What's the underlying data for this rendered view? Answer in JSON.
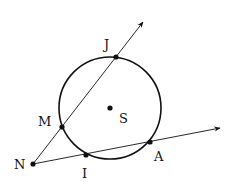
{
  "diagram": {
    "type": "geometry-circle-secants",
    "circle": {
      "center_label": "S",
      "cx": 110,
      "cy": 108,
      "r": 51
    },
    "points": [
      {
        "id": "J",
        "label": "J",
        "x": 116,
        "y": 57,
        "lx": 104,
        "ly": 49
      },
      {
        "id": "M",
        "label": "M",
        "x": 62,
        "y": 127,
        "lx": 38,
        "ly": 126
      },
      {
        "id": "N",
        "label": "N",
        "x": 33,
        "y": 164,
        "lx": 14,
        "ly": 169
      },
      {
        "id": "I",
        "label": "I",
        "x": 86,
        "y": 155,
        "lx": 82,
        "ly": 178
      },
      {
        "id": "A",
        "label": "A",
        "x": 150,
        "y": 142,
        "lx": 154,
        "ly": 161
      },
      {
        "id": "S",
        "label": "S",
        "x": 110,
        "y": 108,
        "lx": 119,
        "ly": 123
      }
    ],
    "rays": [
      {
        "name": "ray-NJ",
        "from": "N",
        "through": [
          "M",
          "J"
        ],
        "x1": 33,
        "y1": 164,
        "x2": 143,
        "y2": 22
      },
      {
        "name": "ray-NA",
        "from": "N",
        "through": [
          "I",
          "A"
        ],
        "x1": 33,
        "y1": 164,
        "x2": 220,
        "y2": 128
      }
    ],
    "colors": {
      "stroke": "#111111",
      "background": "#ffffff"
    }
  }
}
